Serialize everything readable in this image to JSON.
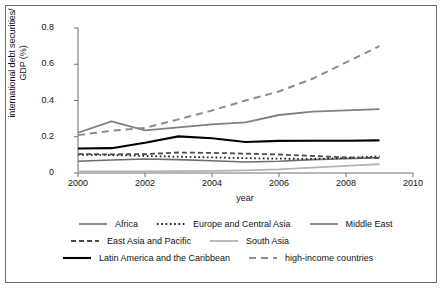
{
  "chart_data": {
    "type": "line",
    "title": "",
    "xlabel": "year",
    "ylabel": "international debt securities/ GDP (%)",
    "ylabel_line1": "international debt securities/",
    "ylabel_line2": "GDP (%)",
    "xlim": [
      2000,
      2010
    ],
    "ylim": [
      0,
      0.8
    ],
    "grid": false,
    "legend_position": "bottom",
    "xticks": [
      "2000",
      "2002",
      "2004",
      "2006",
      "2008",
      "2010"
    ],
    "xtick_values": [
      2000,
      2002,
      2004,
      2006,
      2008,
      2010
    ],
    "yticks": [
      "0",
      "0.2",
      "0.4",
      "0.6",
      "0.8"
    ],
    "ytick_values": [
      0,
      0.2,
      0.4,
      0.6,
      0.8
    ],
    "x": [
      2000,
      2001,
      2002,
      2003,
      2004,
      2005,
      2006,
      2007,
      2008,
      2009
    ],
    "series": [
      {
        "name": "Africa",
        "color": "#6e6e6e",
        "style": "solid",
        "width": 1.6,
        "values": [
          0.065,
          0.072,
          0.077,
          0.074,
          0.068,
          0.061,
          0.065,
          0.074,
          0.079,
          0.085
        ]
      },
      {
        "name": "Europe and Central Asia",
        "color": "#1a1a1a",
        "style": "dotted",
        "width": 1.8,
        "values": [
          0.101,
          0.099,
          0.094,
          0.09,
          0.086,
          0.082,
          0.079,
          0.078,
          0.083,
          0.092
        ]
      },
      {
        "name": "Middle East",
        "color": "#808080",
        "style": "solid",
        "width": 1.8,
        "values": [
          0.222,
          0.285,
          0.235,
          0.252,
          0.268,
          0.279,
          0.32,
          0.339,
          0.345,
          0.352
        ]
      },
      {
        "name": "East Asia and Pacific",
        "color": "#4d4d4d",
        "style": "dashed",
        "width": 1.8,
        "values": [
          0.104,
          0.103,
          0.104,
          0.113,
          0.111,
          0.107,
          0.102,
          0.094,
          0.086,
          0.082
        ]
      },
      {
        "name": "South Asia",
        "color": "#b3b3b3",
        "style": "solid",
        "width": 1.8,
        "values": [
          0.009,
          0.009,
          0.009,
          0.01,
          0.012,
          0.015,
          0.02,
          0.03,
          0.039,
          0.049
        ]
      },
      {
        "name": "Latin America and the Caribbean",
        "color": "#000000",
        "style": "solid",
        "width": 2.1,
        "values": [
          0.135,
          0.137,
          0.167,
          0.202,
          0.192,
          0.171,
          0.177,
          0.178,
          0.178,
          0.18
        ]
      },
      {
        "name": "high-income countries",
        "color": "#8c8c8c",
        "style": "dashed-long",
        "width": 2.0,
        "values": [
          0.209,
          0.233,
          0.249,
          0.296,
          0.345,
          0.4,
          0.45,
          0.52,
          0.61,
          0.7
        ]
      }
    ]
  },
  "legend": {
    "rows": [
      [
        {
          "label": "Africa",
          "series": 0
        },
        {
          "label": "Europe and Central Asia",
          "series": 1
        },
        {
          "label": "Middle East",
          "series": 2
        }
      ],
      [
        {
          "label": "East Asia and Pacific",
          "series": 3
        },
        {
          "label": "South Asia",
          "series": 4
        }
      ],
      [
        {
          "label": "Latin America and the Caribbean",
          "series": 5
        },
        {
          "label": "high-income countries",
          "series": 6
        }
      ]
    ]
  }
}
